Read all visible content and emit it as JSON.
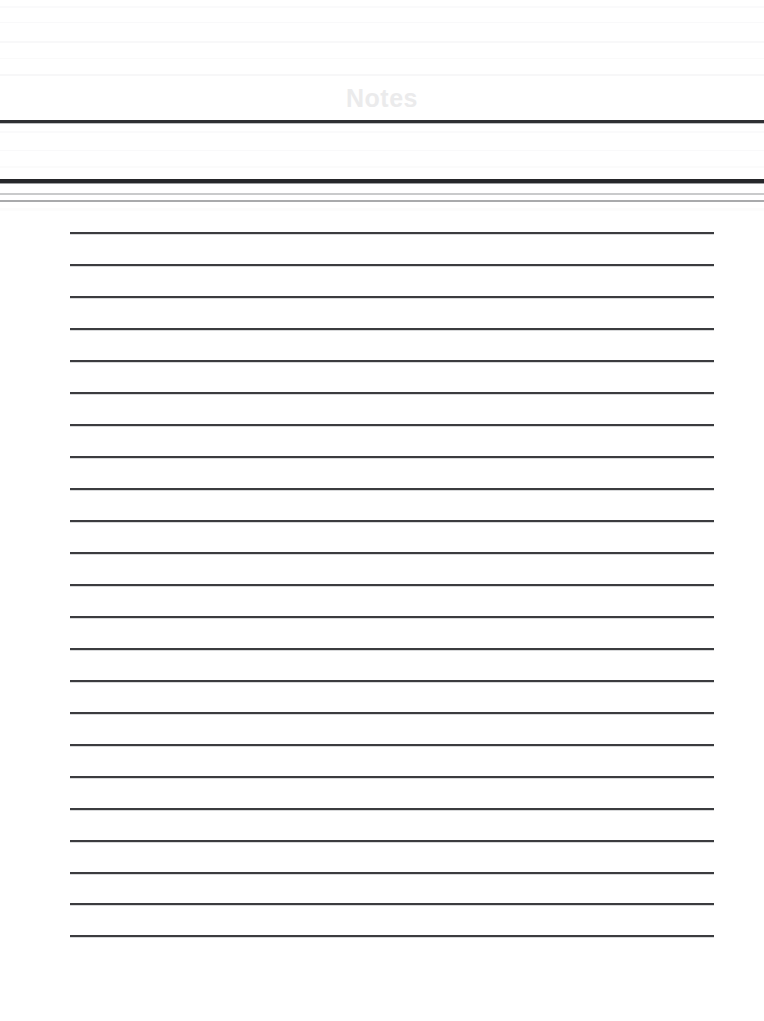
{
  "document": {
    "title": "Notes",
    "type": "ruled-note-paper",
    "background_color": "#ffffff",
    "title_color": "#ebebec",
    "rule_color": "#3b3c3f"
  },
  "header": {
    "title": "Notes",
    "divider_top_color": "#2f3033",
    "divider_mid_color": "#26272a",
    "accent_line_1_color": "#c9cacb",
    "accent_line_2_color": "#a9aaac"
  },
  "note_area": {
    "line_count": 23,
    "first_line_y": 232,
    "line_spacing": 32,
    "line_left": 70,
    "line_width": 644,
    "lines": [
      {
        "index": 1,
        "y": 232,
        "text": ""
      },
      {
        "index": 2,
        "y": 264,
        "text": ""
      },
      {
        "index": 3,
        "y": 296,
        "text": ""
      },
      {
        "index": 4,
        "y": 328,
        "text": ""
      },
      {
        "index": 5,
        "y": 360,
        "text": ""
      },
      {
        "index": 6,
        "y": 392,
        "text": ""
      },
      {
        "index": 7,
        "y": 424,
        "text": ""
      },
      {
        "index": 8,
        "y": 456,
        "text": ""
      },
      {
        "index": 9,
        "y": 488,
        "text": ""
      },
      {
        "index": 10,
        "y": 520,
        "text": ""
      },
      {
        "index": 11,
        "y": 552,
        "text": ""
      },
      {
        "index": 12,
        "y": 584,
        "text": ""
      },
      {
        "index": 13,
        "y": 616,
        "text": ""
      },
      {
        "index": 14,
        "y": 648,
        "text": ""
      },
      {
        "index": 15,
        "y": 680,
        "text": ""
      },
      {
        "index": 16,
        "y": 712,
        "text": ""
      },
      {
        "index": 17,
        "y": 744,
        "text": ""
      },
      {
        "index": 18,
        "y": 776,
        "text": ""
      },
      {
        "index": 19,
        "y": 808,
        "text": ""
      },
      {
        "index": 20,
        "y": 840,
        "text": ""
      },
      {
        "index": 21,
        "y": 872,
        "text": ""
      },
      {
        "index": 22,
        "y": 903,
        "text": ""
      },
      {
        "index": 23,
        "y": 935,
        "text": ""
      }
    ]
  },
  "footer": {
    "content": ""
  }
}
